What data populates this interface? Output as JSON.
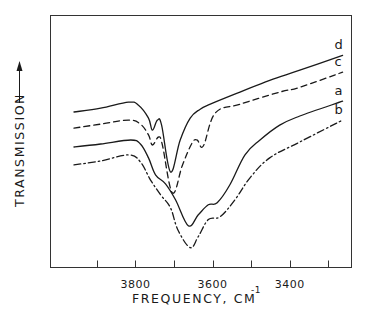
{
  "chart_data": {
    "type": "line",
    "title": "",
    "xlabel": "FREQUENCY, CM",
    "xlabel_superscript": "-1",
    "ylabel": "TRANSMISSION",
    "ylabel_arrow": "up",
    "xlim": [
      4020,
      3240
    ],
    "ylim": [
      0,
      100
    ],
    "x_reversed": true,
    "x_ticks": [
      3900,
      3800,
      3700,
      3600,
      3500,
      3400,
      3300
    ],
    "x_tick_labels": [
      {
        "value": 3800,
        "label": "3800"
      },
      {
        "value": 3600,
        "label": "3600"
      },
      {
        "value": 3400,
        "label": "3400"
      }
    ],
    "y_ticks": [],
    "grid": false,
    "legend": "inline labels at right end of each curve",
    "series": [
      {
        "name": "d",
        "style": "solid",
        "points": [
          [
            3959,
            61.7
          ],
          [
            3890,
            63.2
          ],
          [
            3818,
            65.6
          ],
          [
            3792,
            64.4
          ],
          [
            3766,
            59.3
          ],
          [
            3756,
            54.5
          ],
          [
            3743,
            58.5
          ],
          [
            3732,
            56.5
          ],
          [
            3709,
            37.9
          ],
          [
            3684,
            50.6
          ],
          [
            3658,
            59.3
          ],
          [
            3632,
            62.8
          ],
          [
            3606,
            64.8
          ],
          [
            3529,
            69.6
          ],
          [
            3452,
            74.3
          ],
          [
            3374,
            78.3
          ],
          [
            3263,
            84.2
          ]
        ]
      },
      {
        "name": "c",
        "style": "dashed",
        "points": [
          [
            3959,
            55.3
          ],
          [
            3890,
            56.9
          ],
          [
            3818,
            58.5
          ],
          [
            3787,
            56.9
          ],
          [
            3766,
            52.6
          ],
          [
            3756,
            48.6
          ],
          [
            3740,
            51.8
          ],
          [
            3730,
            48.6
          ],
          [
            3704,
            29.6
          ],
          [
            3678,
            40.7
          ],
          [
            3653,
            49.4
          ],
          [
            3640,
            50.6
          ],
          [
            3624,
            48.2
          ],
          [
            3593,
            61.3
          ],
          [
            3529,
            64.8
          ],
          [
            3426,
            69.6
          ],
          [
            3374,
            71.5
          ],
          [
            3263,
            77.5
          ]
        ]
      },
      {
        "name": "a",
        "style": "solid",
        "points": [
          [
            3959,
            47.8
          ],
          [
            3890,
            49.0
          ],
          [
            3812,
            50.6
          ],
          [
            3787,
            49.0
          ],
          [
            3766,
            43.5
          ],
          [
            3748,
            36.8
          ],
          [
            3722,
            33.2
          ],
          [
            3696,
            26.9
          ],
          [
            3663,
            16.6
          ],
          [
            3637,
            20.9
          ],
          [
            3611,
            24.9
          ],
          [
            3588,
            25.7
          ],
          [
            3555,
            32.8
          ],
          [
            3516,
            44.7
          ],
          [
            3477,
            50.6
          ],
          [
            3426,
            56.5
          ],
          [
            3374,
            60.1
          ],
          [
            3263,
            66.0
          ]
        ]
      },
      {
        "name": "b",
        "style": "dash-dot",
        "points": [
          [
            3959,
            40.7
          ],
          [
            3890,
            42.3
          ],
          [
            3818,
            44.7
          ],
          [
            3787,
            41.9
          ],
          [
            3761,
            34.8
          ],
          [
            3735,
            28.9
          ],
          [
            3709,
            23.7
          ],
          [
            3690,
            15.0
          ],
          [
            3658,
            7.9
          ],
          [
            3637,
            12.3
          ],
          [
            3611,
            19.0
          ],
          [
            3580,
            20.2
          ],
          [
            3542,
            26.9
          ],
          [
            3503,
            35.6
          ],
          [
            3452,
            43.5
          ],
          [
            3374,
            49.8
          ],
          [
            3263,
            58.5
          ]
        ]
      }
    ]
  }
}
